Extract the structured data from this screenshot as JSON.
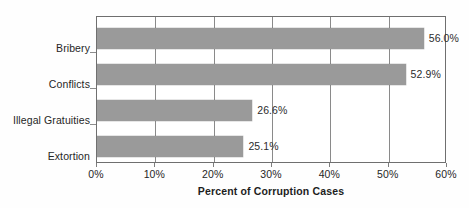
{
  "chart_data": {
    "type": "bar",
    "orientation": "horizontal",
    "title": "",
    "xlabel": "Percent of Corruption Cases",
    "ylabel": "",
    "categories": [
      "Bribery",
      "Conflicts",
      "Illegal Gratuities",
      "Extortion"
    ],
    "values": [
      56.0,
      52.9,
      26.6,
      25.1
    ],
    "value_labels": [
      "56.0%",
      "52.9%",
      "26.6%",
      "25.1%"
    ],
    "xlim": [
      0,
      60
    ],
    "xticks": [
      0,
      10,
      20,
      30,
      40,
      50,
      60
    ],
    "xtick_labels": [
      "0%",
      "10%",
      "20%",
      "30%",
      "40%",
      "50%",
      "60%"
    ],
    "grid": "vertical",
    "legend": "none",
    "bar_color": "#9a9a9a",
    "background_color": "#ffffff",
    "axis_color": "#6f6f6f",
    "text_color": "#262626"
  }
}
